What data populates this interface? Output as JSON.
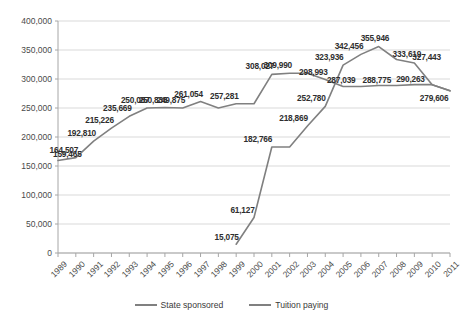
{
  "chart_data": {
    "type": "line",
    "title": "",
    "xlabel": "",
    "ylabel": "",
    "grid": true,
    "legend_position": "bottom",
    "ylim": [
      0,
      400000
    ],
    "ytick_labels": [
      "400,000",
      "350,000",
      "300,000",
      "250,000",
      "200,000",
      "150,000",
      "100,000",
      "50,000",
      "0"
    ],
    "ytick_values": [
      400000,
      350000,
      300000,
      250000,
      200000,
      150000,
      100000,
      50000,
      0
    ],
    "categories": [
      "1989",
      "1990",
      "1991",
      "1992",
      "1993",
      "1994",
      "1995",
      "1996",
      "1997",
      "1998",
      "1999",
      "2000",
      "2001",
      "2002",
      "2003",
      "2004",
      "2005",
      "2006",
      "2007",
      "2008",
      "2009",
      "2010",
      "2011"
    ],
    "series": [
      {
        "name": "State sponsored",
        "color": "#808080",
        "values": [
          159465,
          164507,
          192810,
          215226,
          235669,
          250087,
          250836,
          249875,
          261054,
          249875,
          257281,
          257281,
          308027,
          309990,
          309990,
          298993,
          287039,
          287039,
          288775,
          288775,
          290263,
          290263,
          279606
        ],
        "labels": [
          {
            "x": "1989",
            "value": 159465,
            "text": "159,465"
          },
          {
            "x": "1990",
            "value": 164507,
            "text": "164,507"
          },
          {
            "x": "1991",
            "value": 192810,
            "text": "192,810"
          },
          {
            "x": "1992",
            "value": 215226,
            "text": "215,226"
          },
          {
            "x": "1993",
            "value": 235669,
            "text": "235,669"
          },
          {
            "x": "1994",
            "value": 250087,
            "text": "250,087"
          },
          {
            "x": "1995",
            "value": 250836,
            "text": "250,836"
          },
          {
            "x": "1996",
            "value": 249875,
            "text": "249,875"
          },
          {
            "x": "1997",
            "value": 261054,
            "text": "261,054"
          },
          {
            "x": "1999",
            "value": 257281,
            "text": "257,281"
          },
          {
            "x": "2001",
            "value": 308027,
            "text": "308,027"
          },
          {
            "x": "2002",
            "value": 309990,
            "text": "309,990"
          },
          {
            "x": "2004",
            "value": 298993,
            "text": "298,993"
          },
          {
            "x": "2005",
            "value": 287039,
            "text": "287,039"
          },
          {
            "x": "2007",
            "value": 288775,
            "text": "288,775"
          },
          {
            "x": "2009",
            "value": 290263,
            "text": "290,263"
          },
          {
            "x": "2011",
            "value": 279606,
            "text": "279,606"
          }
        ]
      },
      {
        "name": "Tuition paying",
        "color": "#808080",
        "values": [
          null,
          null,
          null,
          null,
          null,
          null,
          null,
          null,
          null,
          null,
          15075,
          61127,
          182766,
          182766,
          218869,
          252780,
          323936,
          342456,
          355946,
          333619,
          327443,
          290263,
          279606
        ],
        "labels": [
          {
            "x": "1999",
            "value": 15075,
            "text": "15,075"
          },
          {
            "x": "2000",
            "value": 61127,
            "text": "61,127"
          },
          {
            "x": "2001",
            "value": 182766,
            "text": "182,766"
          },
          {
            "x": "2003",
            "value": 218869,
            "text": "218,869"
          },
          {
            "x": "2004",
            "value": 252780,
            "text": "252,780"
          },
          {
            "x": "2005",
            "value": 323936,
            "text": "323,936"
          },
          {
            "x": "2006",
            "value": 342456,
            "text": "342,456"
          },
          {
            "x": "2007",
            "value": 355946,
            "text": "355,946"
          },
          {
            "x": "2008",
            "value": 333619,
            "text": "333,619"
          },
          {
            "x": "2009",
            "value": 327443,
            "text": "327,443"
          }
        ]
      }
    ]
  },
  "legend": {
    "items": [
      {
        "label": "State sponsored",
        "color": "#808080"
      },
      {
        "label": "Tuition paying",
        "color": "#808080"
      }
    ]
  },
  "axis_colors": {
    "grid": "#d9d9d9",
    "axis": "#a6a6a6",
    "tick_text": "#4a4a4a"
  }
}
